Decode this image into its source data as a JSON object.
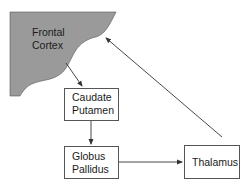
{
  "diagram": {
    "type": "flow",
    "colors": {
      "cortex_fill": "#9a9a9a",
      "box_stroke": "#555555",
      "edge": "#333333",
      "text": "#1a1a1a"
    },
    "nodes": {
      "frontal_cortex": {
        "line1": "Frontal",
        "line2": "Cortex"
      },
      "caudate_putamen": {
        "line1": "Caudate",
        "line2": "Putamen"
      },
      "globus_pallidus": {
        "line1": "Globus",
        "line2": "Pallidus"
      },
      "thalamus": {
        "line1": "Thalamus"
      }
    },
    "edges": [
      {
        "from": "Frontal Cortex",
        "to": "Caudate Putamen"
      },
      {
        "from": "Caudate Putamen",
        "to": "Globus Pallidus"
      },
      {
        "from": "Globus Pallidus",
        "to": "Thalamus"
      },
      {
        "from": "Thalamus",
        "to": "Frontal Cortex"
      }
    ]
  }
}
